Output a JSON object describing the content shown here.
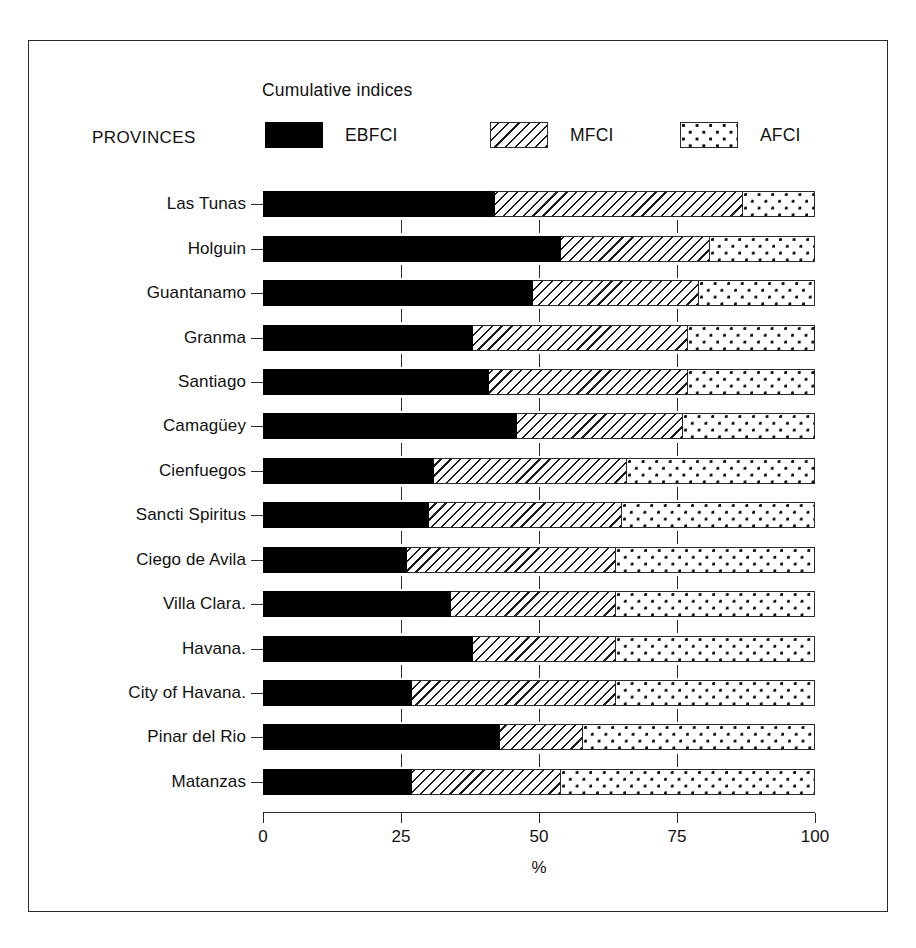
{
  "figure": {
    "legend_title": "Cumulative indices",
    "group_axis_label": "PROVINCES",
    "x_axis_label": "%"
  },
  "legend": {
    "items": [
      {
        "label": "EBFCI",
        "pattern": "solid-black",
        "color": "#000000"
      },
      {
        "label": "MFCI",
        "pattern": "diagonal-hatch",
        "color": "#1a1a1a"
      },
      {
        "label": "AFCI",
        "pattern": "dots",
        "color": "#111111"
      }
    ]
  },
  "chart_data": {
    "type": "bar",
    "orientation": "horizontal",
    "stacked": true,
    "title": "Cumulative indices",
    "xlabel": "%",
    "ylabel": "PROVINCES",
    "xlim": [
      0,
      100
    ],
    "xticks": [
      "0",
      "25",
      "50",
      "75",
      "100"
    ],
    "xtick_values": [
      0,
      25,
      50,
      75,
      100
    ],
    "grid": false,
    "legend_position": "top",
    "categories": [
      "Las Tunas",
      "Holguin",
      "Guantanamo",
      "Granma",
      "Santiago",
      "Camagüey",
      "Cienfuegos",
      "Sancti Spiritus",
      "Ciego de Avila",
      "Villa Clara.",
      "Havana.",
      "City of Havana.",
      "Pinar del Rio",
      "Matanzas"
    ],
    "series": [
      {
        "name": "EBFCI",
        "values": [
          42,
          54,
          49,
          38,
          41,
          46,
          31,
          30,
          26,
          34,
          38,
          27,
          43,
          27
        ]
      },
      {
        "name": "MFCI",
        "values": [
          45,
          27,
          30,
          39,
          36,
          30,
          35,
          35,
          38,
          30,
          26,
          37,
          15,
          27
        ]
      },
      {
        "name": "AFCI",
        "values": [
          13,
          19,
          21,
          23,
          23,
          24,
          34,
          35,
          36,
          36,
          36,
          36,
          42,
          46
        ]
      }
    ],
    "cumulative_boundaries": [
      {
        "category": "Las Tunas",
        "ebfci_end": 42,
        "mfci_end": 87,
        "afci_end": 100
      },
      {
        "category": "Holguin",
        "ebfci_end": 54,
        "mfci_end": 81,
        "afci_end": 100
      },
      {
        "category": "Guantanamo",
        "ebfci_end": 49,
        "mfci_end": 79,
        "afci_end": 100
      },
      {
        "category": "Granma",
        "ebfci_end": 38,
        "mfci_end": 77,
        "afci_end": 100
      },
      {
        "category": "Santiago",
        "ebfci_end": 41,
        "mfci_end": 77,
        "afci_end": 100
      },
      {
        "category": "Camagüey",
        "ebfci_end": 46,
        "mfci_end": 76,
        "afci_end": 100
      },
      {
        "category": "Cienfuegos",
        "ebfci_end": 31,
        "mfci_end": 66,
        "afci_end": 100
      },
      {
        "category": "Sancti Spiritus",
        "ebfci_end": 30,
        "mfci_end": 65,
        "afci_end": 100
      },
      {
        "category": "Ciego de Avila",
        "ebfci_end": 26,
        "mfci_end": 64,
        "afci_end": 100
      },
      {
        "category": "Villa Clara.",
        "ebfci_end": 34,
        "mfci_end": 64,
        "afci_end": 100
      },
      {
        "category": "Havana.",
        "ebfci_end": 38,
        "mfci_end": 64,
        "afci_end": 100
      },
      {
        "category": "City of Havana.",
        "ebfci_end": 27,
        "mfci_end": 64,
        "afci_end": 100
      },
      {
        "category": "Pinar del Rio",
        "ebfci_end": 43,
        "mfci_end": 58,
        "afci_end": 100
      },
      {
        "category": "Matanzas",
        "ebfci_end": 27,
        "mfci_end": 54,
        "afci_end": 100
      }
    ]
  }
}
